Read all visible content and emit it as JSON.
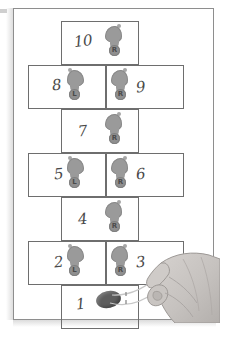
{
  "illustration": {
    "title": "Hopscotch court diagram",
    "subject": "hopscotch",
    "paper_color": "#ffffff",
    "line_color": "#6e6e6e",
    "footprint_color": "#9a9a9a",
    "stone_color": "#5e5e5e",
    "hand_color": "#c9c5c2"
  },
  "court": {
    "squares": [
      {
        "number": "10",
        "row": 1,
        "span": "center",
        "foot": "R",
        "foot_label": "R",
        "number_side": "left"
      },
      {
        "number": "8",
        "row": 2,
        "span": "left",
        "foot": "L",
        "foot_label": "L",
        "number_side": "left"
      },
      {
        "number": "9",
        "row": 2,
        "span": "right",
        "foot": "R",
        "foot_label": "R",
        "number_side": "right"
      },
      {
        "number": "7",
        "row": 3,
        "span": "center",
        "foot": "R",
        "foot_label": "R",
        "number_side": "left"
      },
      {
        "number": "5",
        "row": 4,
        "span": "left",
        "foot": "L",
        "foot_label": "L",
        "number_side": "left"
      },
      {
        "number": "6",
        "row": 4,
        "span": "right",
        "foot": "R",
        "foot_label": "R",
        "number_side": "right"
      },
      {
        "number": "4",
        "row": 5,
        "span": "center",
        "foot": "R",
        "foot_label": "R",
        "number_side": "left"
      },
      {
        "number": "2",
        "row": 6,
        "span": "left",
        "foot": "L",
        "foot_label": "L",
        "number_side": "left"
      },
      {
        "number": "3",
        "row": 6,
        "span": "right",
        "foot": "R",
        "foot_label": "R",
        "number_side": "right"
      },
      {
        "number": "1",
        "row": 7,
        "span": "center",
        "foot": "none",
        "foot_label": "",
        "number_side": "left"
      }
    ],
    "marker": {
      "name": "stone",
      "located_in_square": "1"
    },
    "hand": {
      "action": "tossing the stone into square 1"
    }
  }
}
